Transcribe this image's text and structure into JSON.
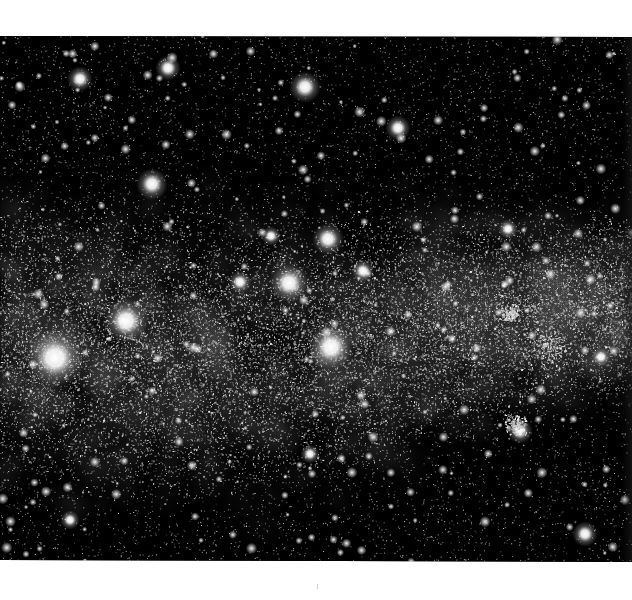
{
  "image": {
    "subject": "Milky Way star field",
    "description": "Grayscale astrophotograph of a dense Milky Way band crossing the frame horizontally, with a dark dust lane (Coalsack-like nebula) left of center and several bright foreground stars.",
    "colors": {
      "page_background": "#ffffff",
      "sky": "#000000",
      "milky_way_glow": "#6e6e6e",
      "star": "#ffffff"
    },
    "features": [
      {
        "name": "bright-star-left",
        "kind": "bright star"
      },
      {
        "name": "bright-star-upper-left",
        "kind": "bright star"
      },
      {
        "name": "bright-star-center",
        "kind": "bright star"
      },
      {
        "name": "bright-star-center-lower",
        "kind": "bright star"
      },
      {
        "name": "bright-star-upper-center",
        "kind": "bright star"
      },
      {
        "name": "dark-dust-lane",
        "kind": "dark nebula"
      },
      {
        "name": "star-cluster-right",
        "kind": "star cluster"
      }
    ]
  }
}
